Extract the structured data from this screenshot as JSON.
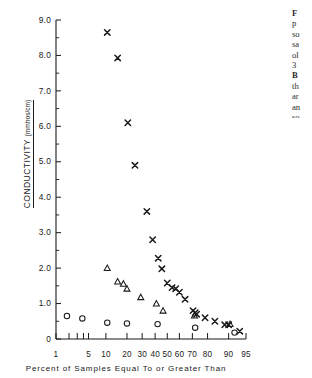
{
  "figure": {
    "caption_lines": [
      {
        "text": "F",
        "bold": true
      },
      {
        "text": "p",
        "bold": false
      },
      {
        "text": "so",
        "bold": false
      },
      {
        "text": "sa",
        "bold": false
      },
      {
        "text": "ol",
        "bold": false
      },
      {
        "text": "3",
        "bold": false
      },
      {
        "text": "B",
        "bold": true
      },
      {
        "text": "th",
        "bold": false
      },
      {
        "text": "ar",
        "bold": false
      },
      {
        "text": "an",
        "bold": false
      },
      {
        "text": "so",
        "bold": false
      }
    ]
  },
  "chart_data": {
    "type": "scatter",
    "title": "",
    "xlabel": "Percent of Samples Equal To or Greater Than",
    "ylabel": "CONDUCTIVITY",
    "yunits": "(mmhos/cm)",
    "ylim": [
      0,
      9.0
    ],
    "yticks": [
      0,
      1.0,
      2.0,
      3.0,
      4.0,
      5.0,
      6.0,
      7.0,
      8.0,
      9.0
    ],
    "ytick_labels": [
      "0",
      "1.0",
      "2.0",
      "3.0",
      "4.0",
      "5.0",
      "6.0",
      "7.0",
      "8.0",
      "9.0"
    ],
    "yminor_step": 0.5,
    "x_scale": "probability",
    "xlim": [
      1,
      95
    ],
    "xticks": [
      1,
      2,
      3,
      4,
      5,
      10,
      20,
      30,
      40,
      50,
      60,
      70,
      80,
      90,
      95
    ],
    "xtick_labels": [
      "1",
      "",
      "",
      "",
      "5",
      "10",
      "20",
      "30",
      "40",
      "50",
      "60",
      "70",
      "80",
      "90",
      "95"
    ],
    "grid": false,
    "legend": "none",
    "series": [
      {
        "name": "x-marker-series",
        "marker": "x",
        "points": [
          [
            10.5,
            8.65
          ],
          [
            15.0,
            7.93
          ],
          [
            20.5,
            6.1
          ],
          [
            25.0,
            4.9
          ],
          [
            33.5,
            3.6
          ],
          [
            38.0,
            2.8
          ],
          [
            42.5,
            2.28
          ],
          [
            45.5,
            1.98
          ],
          [
            50.0,
            1.58
          ],
          [
            54.0,
            1.45
          ],
          [
            57.0,
            1.42
          ],
          [
            60.0,
            1.32
          ],
          [
            64.5,
            1.12
          ],
          [
            70.5,
            0.8
          ],
          [
            72.0,
            0.74
          ],
          [
            73.0,
            0.7
          ],
          [
            78.5,
            0.6
          ],
          [
            84.0,
            0.5
          ],
          [
            88.5,
            0.4
          ],
          [
            90.0,
            0.4
          ],
          [
            93.5,
            0.22
          ]
        ]
      },
      {
        "name": "triangle-marker-series",
        "marker": "triangle",
        "points": [
          [
            10.5,
            2.0
          ],
          [
            15.0,
            1.62
          ],
          [
            18.0,
            1.56
          ],
          [
            20.0,
            1.42
          ],
          [
            29.0,
            1.18
          ],
          [
            41.0,
            1.0
          ],
          [
            46.5,
            0.8
          ],
          [
            71.5,
            0.66
          ],
          [
            90.5,
            0.42
          ]
        ]
      },
      {
        "name": "circle-marker-series",
        "marker": "circle",
        "points": [
          [
            1.8,
            0.65
          ],
          [
            3.8,
            0.58
          ],
          [
            10.5,
            0.46
          ],
          [
            20.0,
            0.44
          ],
          [
            42.0,
            0.42
          ],
          [
            72.0,
            0.32
          ],
          [
            92.0,
            0.18
          ]
        ]
      }
    ]
  }
}
